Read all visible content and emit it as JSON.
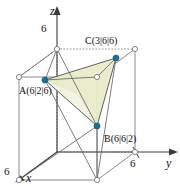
{
  "figure": {
    "type": "3d-coordinate-system-with-cube-and-triangle",
    "background_color": "#ffffff",
    "axes": [
      {
        "name": "z",
        "label": "z",
        "direction": "up",
        "tick_label": "6"
      },
      {
        "name": "y",
        "label": "y",
        "direction": "right",
        "tick_label": "6"
      },
      {
        "name": "x",
        "label": "x",
        "direction": "down-left",
        "tick_label": "6"
      }
    ],
    "axis_labels": {
      "z": "z",
      "y": "y",
      "x": "x"
    },
    "tick_labels": {
      "z": "6",
      "y": "6",
      "x": "6"
    },
    "points": [
      {
        "name": "A",
        "label": "A(6|2|6)",
        "coords": [
          6,
          2,
          6
        ],
        "marker_color": "#1b6e94"
      },
      {
        "name": "B",
        "label": "B(6|6|2)",
        "coords": [
          6,
          6,
          2
        ],
        "marker_color": "#1b6e94"
      },
      {
        "name": "C",
        "label": "C(3|6|6)",
        "coords": [
          3,
          6,
          6
        ],
        "marker_color": "#1b6e94"
      }
    ],
    "cube": {
      "edge_length": 6,
      "edge_color": "#8a8a8a",
      "hidden_edge_style": "dashed"
    },
    "triangle": {
      "vertices": [
        "A",
        "B",
        "C"
      ],
      "fill_color": "#e9ebcb",
      "edge_color": "#5f5f5f"
    },
    "colors": {
      "axis": "#3a3a3a",
      "cube_edge": "#8a8a8a",
      "triangle_fill": "#e9ebcb",
      "triangle_fill_light": "#f1f2e2",
      "point_marker": "#1b6e94",
      "text": "#111111"
    }
  }
}
